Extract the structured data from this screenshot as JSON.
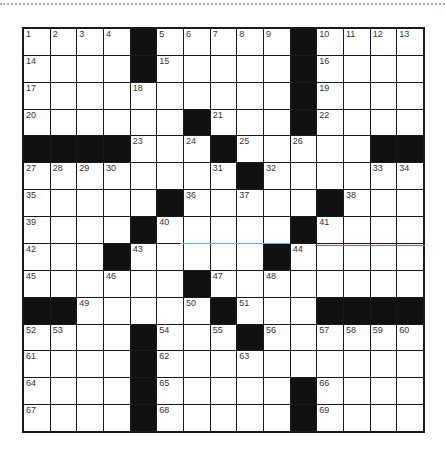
{
  "puzzle": {
    "rows": 15,
    "cols": 15,
    "grid": [
      [
        "1",
        "2",
        "3",
        "4",
        "#",
        "5",
        "6",
        "7",
        "8",
        "9",
        "#",
        "10",
        "11",
        "12",
        "13"
      ],
      [
        "14",
        "",
        "",
        "",
        "#",
        "15",
        "",
        "",
        "",
        "",
        "#",
        "16",
        "",
        "",
        ""
      ],
      [
        "17",
        "",
        "",
        "",
        "18",
        "",
        "",
        "",
        "",
        "",
        "#",
        "19",
        "",
        "",
        ""
      ],
      [
        "20",
        "",
        "",
        "",
        "",
        "",
        "#",
        "21",
        "",
        "",
        "#",
        "22",
        "",
        "",
        ""
      ],
      [
        "#",
        "#",
        "#",
        "#",
        "23",
        "",
        "24",
        "#",
        "25",
        "",
        "26",
        "",
        "",
        "#",
        "#"
      ],
      [
        "27",
        "28",
        "29",
        "30",
        "",
        "",
        "",
        "31",
        "#",
        "32",
        "",
        "",
        "",
        "33",
        "34"
      ],
      [
        "35",
        "",
        "",
        "",
        "",
        "#",
        "36",
        "",
        "37",
        "",
        "",
        "#",
        "38",
        "",
        ""
      ],
      [
        "39",
        "",
        "",
        "",
        "#",
        "40",
        "",
        "",
        "",
        "",
        "#",
        "41",
        "",
        "",
        ""
      ],
      [
        "42",
        "",
        "",
        "#",
        "43",
        "",
        "",
        "",
        "",
        "#",
        "44",
        "",
        "",
        "",
        ""
      ],
      [
        "45",
        "",
        "",
        "46",
        "",
        "",
        "#",
        "47",
        "",
        "48",
        "",
        "",
        "",
        "",
        ""
      ],
      [
        "#",
        "#",
        "49",
        "",
        "",
        "",
        "50",
        "#",
        "51",
        "",
        "",
        "#",
        "#",
        "#",
        "#"
      ],
      [
        "52",
        "53",
        "",
        "",
        "#",
        "54",
        "",
        "55",
        "#",
        "56",
        "",
        "57",
        "58",
        "59",
        "60"
      ],
      [
        "61",
        "",
        "",
        "",
        "#",
        "62",
        "",
        "",
        "63",
        "",
        "",
        "",
        "",
        "",
        ""
      ],
      [
        "64",
        "",
        "",
        "",
        "#",
        "65",
        "",
        "",
        "",
        "",
        "#",
        "66",
        "",
        "",
        ""
      ],
      [
        "67",
        "",
        "",
        "",
        "#",
        "68",
        "",
        "",
        "",
        "",
        "#",
        "69",
        "",
        "",
        ""
      ]
    ]
  },
  "highlights": [
    {
      "name": "cyan-line",
      "color": "#3fd0c9",
      "x": 180,
      "y": 243,
      "width": 110
    },
    {
      "name": "red-line",
      "color": "#e0405a",
      "x": 315,
      "y": 245,
      "width": 110
    }
  ],
  "colors": {
    "block": "#111111",
    "border_dots": "#d79bc3"
  }
}
